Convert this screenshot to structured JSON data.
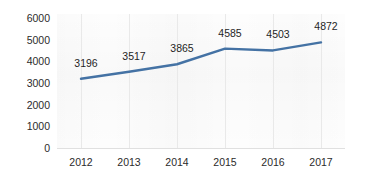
{
  "chart_data": {
    "type": "line",
    "title": "",
    "subtitle": "",
    "xlabel": "",
    "ylabel": "",
    "categories": [
      "2012",
      "2013",
      "2014",
      "2015",
      "2016",
      "2017"
    ],
    "values": [
      3196,
      3517,
      3865,
      4503,
      4503,
      4872
    ],
    "series": [
      {
        "name": "",
        "values": [
          3196,
          3517,
          3865,
          4585,
          4503,
          4872
        ],
        "color": "#4472a4",
        "show_markers": false,
        "data_labels": [
          "3196",
          "3517",
          "3865",
          "4585",
          "4503",
          "4872"
        ]
      }
    ],
    "ylim": [
      0,
      6000
    ],
    "y_ticks": [
      0,
      1000,
      2000,
      3000,
      4000,
      5000,
      6000
    ],
    "y_tick_labels": [
      "0",
      "1000",
      "2000",
      "3000",
      "4000",
      "5000",
      "6000"
    ],
    "x_tick_labels": [
      "2012",
      "2013",
      "2014",
      "2015",
      "2016",
      "2017"
    ],
    "grid": {
      "horizontal": false,
      "vertical": true,
      "color": "#e9e9e9"
    },
    "legend": {
      "visible": false,
      "position": "none",
      "entries": []
    },
    "annotations": [],
    "colors": {
      "line": "#4472a4",
      "axis": "#e0e0e0",
      "text": "#2b2b2b",
      "data_label": "#1f1f1f",
      "plot_background": "#fdfdfd",
      "figure_background": "#ffffff"
    }
  }
}
